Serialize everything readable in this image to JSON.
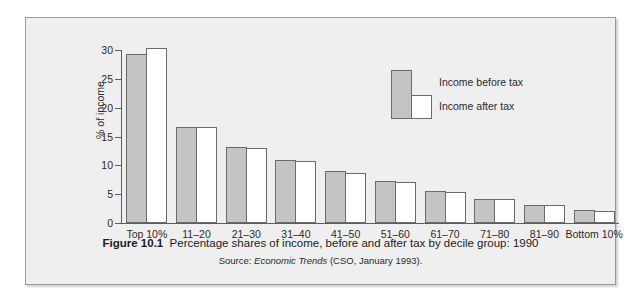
{
  "figure": {
    "caption_prefix": "Figure 10.1",
    "caption_text": "Percentage shares of income, before and after tax by decile group: 1990",
    "source_prefix": "Source:",
    "source_publication": "Economic Trends",
    "source_detail": "(CSO, January 1993)."
  },
  "legend": {
    "before_label": "Income before tax",
    "after_label": "Income after tax"
  },
  "colors": {
    "bar_before_fill": "#c4c4c4",
    "bar_after_fill": "#ffffff",
    "bar_outline": "#6b6b6b",
    "axis": "#5d5d5d",
    "panel_background": "#efefef",
    "frame_border": "#9a9a9a",
    "text": "#2b2b2b"
  },
  "chart_data": {
    "type": "bar",
    "title": "Percentage shares of income, before and after tax by decile group: 1990",
    "subtitle": "Source: Economic Trends (CSO, January 1993).",
    "xlabel": "",
    "ylabel": "% of income",
    "ylim": [
      0,
      30
    ],
    "ytick_values": [
      0,
      5,
      10,
      15,
      20,
      25,
      30
    ],
    "ytick_labels": [
      "0",
      "5",
      "10",
      "15",
      "20",
      "25",
      "30"
    ],
    "grid": false,
    "legend_position": "inside upper center",
    "categories": [
      "Top 10%",
      "11–20",
      "21–30",
      "31–40",
      "41–50",
      "51–60",
      "61–70",
      "71–80",
      "81–90",
      "Bottom 10%"
    ],
    "series": [
      {
        "name": "Income before tax",
        "values": [
          29.3,
          16.6,
          13.2,
          10.9,
          9.1,
          7.3,
          5.6,
          4.2,
          3.1,
          2.3
        ]
      },
      {
        "name": "Income after tax",
        "values": [
          30.4,
          16.6,
          13.0,
          10.7,
          8.7,
          7.1,
          5.4,
          4.2,
          3.2,
          2.1
        ]
      }
    ]
  }
}
